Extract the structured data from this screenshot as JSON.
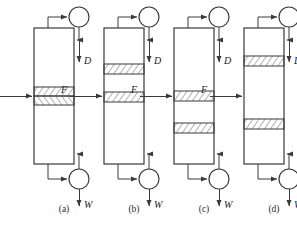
{
  "figure": {
    "name": "distillation-column-configurations",
    "background_color": "#ffffff",
    "line_color": "#3a3a3a",
    "hatch_color": "#555555",
    "text_color": "#1a1a1a",
    "width": 297,
    "height": 227
  },
  "labels": {
    "feed": "F",
    "distillate": "D",
    "bottoms": "W"
  },
  "captions": [
    {
      "id": "a",
      "text": "(a)"
    },
    {
      "id": "b",
      "text": "(b)"
    },
    {
      "id": "c",
      "text": "(c)"
    },
    {
      "id": "d",
      "text": "(d)"
    }
  ],
  "columns": [
    {
      "id": "a",
      "caption": "(a)",
      "shell": {
        "x": 34,
        "y": 28,
        "width": 40,
        "height": 136
      },
      "feed_y": 96,
      "feed_label": "F",
      "distillate_label": "D",
      "bottoms_label": "W",
      "condenser": {
        "cx": 79,
        "cy": 17,
        "r": 10
      },
      "reboiler": {
        "cx": 79,
        "cy": 179,
        "r": 10
      },
      "packed_sections": [
        {
          "y": 87,
          "height": 9,
          "hatch": "forward"
        },
        {
          "y": 96,
          "height": 9,
          "hatch": "backward"
        }
      ]
    },
    {
      "id": "b",
      "caption": "(b)",
      "shell": {
        "x": 104,
        "y": 28,
        "width": 40,
        "height": 136
      },
      "feed_y": 96,
      "feed_label": "F",
      "distillate_label": "D",
      "bottoms_label": "W",
      "condenser": {
        "cx": 149,
        "cy": 17,
        "r": 10
      },
      "reboiler": {
        "cx": 149,
        "cy": 179,
        "r": 10
      },
      "packed_sections": [
        {
          "y": 64,
          "height": 10,
          "hatch": "forward"
        },
        {
          "y": 92,
          "height": 10,
          "hatch": "forward"
        }
      ]
    },
    {
      "id": "c",
      "caption": "(c)",
      "shell": {
        "x": 174,
        "y": 28,
        "width": 40,
        "height": 136
      },
      "feed_y": 96,
      "feed_label": "F",
      "distillate_label": "D",
      "bottoms_label": "W",
      "condenser": {
        "cx": 219,
        "cy": 17,
        "r": 10
      },
      "reboiler": {
        "cx": 219,
        "cy": 179,
        "r": 10
      },
      "packed_sections": [
        {
          "y": 91,
          "height": 10,
          "hatch": "forward"
        },
        {
          "y": 123,
          "height": 10,
          "hatch": "forward"
        }
      ]
    },
    {
      "id": "d",
      "caption": "(d)",
      "shell": {
        "x": 244,
        "y": 28,
        "width": 40,
        "height": 136
      },
      "feed_y": 96,
      "feed_label": "F",
      "distillate_label": "D",
      "bottoms_label": "W",
      "condenser": {
        "cx": 289,
        "cy": 17,
        "r": 10
      },
      "reboiler": {
        "cx": 289,
        "cy": 179,
        "r": 10
      },
      "packed_sections": [
        {
          "y": 56,
          "height": 10,
          "hatch": "forward"
        },
        {
          "y": 119,
          "height": 10,
          "hatch": "forward"
        }
      ]
    }
  ]
}
